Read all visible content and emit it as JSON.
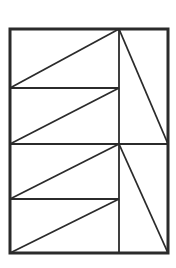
{
  "figure": {
    "canvas": {
      "width": 176,
      "height": 268
    },
    "colors": {
      "background": "#ffffff",
      "stroke": "#2b2b2b",
      "fill": "none"
    },
    "stroke_widths": {
      "outer_border": 3.0,
      "inner_divider": 1.8,
      "diagonal": 1.8
    },
    "geometry": {
      "bounds": {
        "left": 10,
        "top": 29,
        "right": 168,
        "bottom": 253
      },
      "vertical_divider_x": 119,
      "horizontal_divider_ys": [
        88,
        144,
        199
      ],
      "full_width_divider_ys": [
        144
      ],
      "short_divider_ys": [
        88,
        199
      ],
      "apex_top": {
        "x": 119,
        "y": 29
      },
      "apex_middle": {
        "x": 119,
        "y": 144
      }
    },
    "outer_border": {
      "label": "outer-rectangle",
      "points": "10,29 168,29 168,253 10,253"
    },
    "dividers": [
      {
        "label": "vertical-divider",
        "x1": 119,
        "y1": 29,
        "x2": 119,
        "y2": 253
      },
      {
        "label": "horizontal-divider-upper-short",
        "x1": 10,
        "y1": 88,
        "x2": 119,
        "y2": 88
      },
      {
        "label": "horizontal-divider-middle-full",
        "x1": 10,
        "y1": 144,
        "x2": 168,
        "y2": 144
      },
      {
        "label": "horizontal-divider-lower-short",
        "x1": 10,
        "y1": 199,
        "x2": 119,
        "y2": 199
      }
    ],
    "left_diagonals": [
      {
        "label": "diagonal-band-1",
        "x1": 10,
        "y1": 88,
        "x2": 119,
        "y2": 29
      },
      {
        "label": "diagonal-band-2",
        "x1": 10,
        "y1": 144,
        "x2": 119,
        "y2": 88
      },
      {
        "label": "diagonal-band-3",
        "x1": 10,
        "y1": 199,
        "x2": 119,
        "y2": 144
      },
      {
        "label": "diagonal-band-4",
        "x1": 10,
        "y1": 253,
        "x2": 119,
        "y2": 199
      }
    ],
    "right_diagonals": [
      {
        "label": "diagonal-upper-right",
        "x1": 119,
        "y1": 29,
        "x2": 168,
        "y2": 144
      },
      {
        "label": "diagonal-lower-right",
        "x1": 119,
        "y1": 144,
        "x2": 168,
        "y2": 253
      }
    ],
    "region_count": 10,
    "shape_names": [
      "upper-left-triangle-1",
      "upper-left-triangle-2",
      "lower-left-triangle-3",
      "lower-left-triangle-4",
      "upper-right-triangle",
      "lower-right-triangle"
    ]
  }
}
